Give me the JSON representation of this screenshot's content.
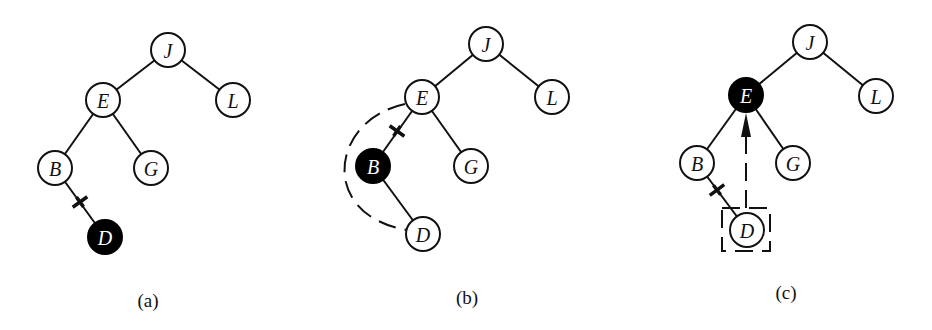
{
  "figure": {
    "node_radius": 17,
    "colors": {
      "stroke": "#111111",
      "highlight": "#000000",
      "background": "#ffffff"
    },
    "panels": [
      {
        "id": "a",
        "caption": "(a)",
        "caption_pos": [
          148,
          300
        ],
        "nodes": [
          {
            "key": "J",
            "x": 168,
            "y": 50,
            "filled": false
          },
          {
            "key": "E",
            "x": 103,
            "y": 100,
            "filled": false
          },
          {
            "key": "L",
            "x": 233,
            "y": 100,
            "filled": false
          },
          {
            "key": "B",
            "x": 55,
            "y": 168,
            "filled": false
          },
          {
            "key": "G",
            "x": 151,
            "y": 168,
            "filled": false
          },
          {
            "key": "D",
            "x": 105,
            "y": 237,
            "filled": true
          }
        ],
        "edges": [
          [
            "J",
            "E"
          ],
          [
            "J",
            "L"
          ],
          [
            "E",
            "B"
          ],
          [
            "E",
            "G"
          ],
          [
            "B",
            "D"
          ]
        ],
        "cut_marks": [
          {
            "x": 80,
            "y": 202,
            "edge": [
              "B",
              "D"
            ]
          }
        ]
      },
      {
        "id": "b",
        "caption": "(b)",
        "caption_pos": [
          467,
          297
        ],
        "nodes": [
          {
            "key": "J",
            "x": 486,
            "y": 44,
            "filled": false
          },
          {
            "key": "E",
            "x": 422,
            "y": 97,
            "filled": false
          },
          {
            "key": "L",
            "x": 552,
            "y": 97,
            "filled": false
          },
          {
            "key": "B",
            "x": 373,
            "y": 166,
            "filled": true
          },
          {
            "key": "G",
            "x": 471,
            "y": 166,
            "filled": false
          },
          {
            "key": "D",
            "x": 423,
            "y": 234,
            "filled": false
          }
        ],
        "edges": [
          [
            "J",
            "E"
          ],
          [
            "J",
            "L"
          ],
          [
            "E",
            "B"
          ],
          [
            "E",
            "G"
          ],
          [
            "B",
            "D"
          ]
        ],
        "cut_marks": [
          {
            "x": 397,
            "y": 131,
            "edge": [
              "E",
              "B"
            ]
          }
        ],
        "dashed_curve": {
          "from": "E",
          "to": "D",
          "path": "M 405 104 C 330 120, 318 215, 407 230"
        }
      },
      {
        "id": "c",
        "caption": "(c)",
        "caption_pos": [
          786,
          292
        ],
        "nodes": [
          {
            "key": "J",
            "x": 810,
            "y": 42,
            "filled": false
          },
          {
            "key": "E",
            "x": 746,
            "y": 95,
            "filled": true
          },
          {
            "key": "L",
            "x": 876,
            "y": 96,
            "filled": false
          },
          {
            "key": "B",
            "x": 697,
            "y": 163,
            "filled": false
          },
          {
            "key": "G",
            "x": 793,
            "y": 163,
            "filled": false
          },
          {
            "key": "D",
            "x": 747,
            "y": 230,
            "filled": false
          }
        ],
        "edges": [
          [
            "J",
            "E"
          ],
          [
            "J",
            "L"
          ],
          [
            "E",
            "B"
          ],
          [
            "E",
            "G"
          ],
          [
            "B",
            "D"
          ]
        ],
        "cut_marks": [
          {
            "x": 717,
            "y": 190,
            "edge": [
              "B",
              "D"
            ]
          }
        ],
        "dashed_box": {
          "x": 722,
          "y": 208,
          "w": 48,
          "h": 43
        },
        "arrow": {
          "from": [
            746,
            208
          ],
          "to": [
            746,
            113
          ]
        }
      }
    ]
  }
}
